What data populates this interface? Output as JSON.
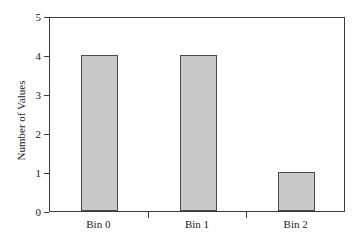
{
  "chart_data": {
    "type": "bar",
    "title": "",
    "subtitle": "",
    "xlabel": "",
    "ylabel": "Number of Values",
    "categories": [
      "Bin 0",
      "Bin 1",
      "Bin 2"
    ],
    "values": [
      4,
      4,
      1
    ],
    "ylim": [
      0,
      5
    ],
    "yticks": [
      "0",
      "1",
      "2",
      "3",
      "4",
      "5"
    ],
    "ytick_values": [
      0,
      1,
      2,
      3,
      4,
      5
    ],
    "grid": false,
    "legend": null,
    "legend_position": "none",
    "annotations": [],
    "colors": {
      "bar_fill": "#c9c9c9",
      "bar_edge": "#4a4a4a",
      "axis": "#3c3c3c",
      "text": "#1a1a1a",
      "background": "#ffffff"
    }
  }
}
